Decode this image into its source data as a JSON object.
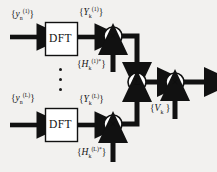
{
  "figure": {
    "name": "frequency-domain-maximal-ratio-combining-diagram",
    "background_color": "#f2f1ef",
    "ink_color": "#111111"
  },
  "blocks": {
    "dft_top_label": "DFT",
    "dft_bottom_label": "DFT"
  },
  "nodes": {
    "multiply_glyph": "×",
    "sum_glyph": "Σ"
  },
  "labels": {
    "input_top": {
      "base": "y",
      "sub": "n",
      "sup": "(1)"
    },
    "input_bottom": {
      "base": "y",
      "sub": "n",
      "sup": "(L)"
    },
    "dft_out_top": {
      "base": "Y",
      "sub": "k",
      "sup": "(1)"
    },
    "dft_out_bottom": {
      "base": "Y",
      "sub": "k",
      "sup": "(L)"
    },
    "channel_top": {
      "base": "H",
      "sub": "k",
      "sup": "(1)*"
    },
    "channel_bottom": {
      "base": "H",
      "sub": "k",
      "sup": "(L)*"
    },
    "equalizer": {
      "base": "V",
      "sub": "k",
      "sup": ""
    }
  },
  "ellipsis": {
    "dot_count": 3,
    "meaning": "additional-branches"
  }
}
